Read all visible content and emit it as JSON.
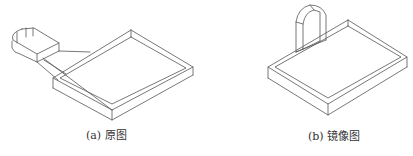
{
  "figures": [
    {
      "id": "a",
      "caption": "(a) 原图",
      "description": "Isometric wireframe of a rectangular tray with a stadium-shaped boss connected by lofted lines"
    },
    {
      "id": "b",
      "caption": "(b) 镜像图",
      "description": "Isometric wireframe of a rectangular tray with an upright arch-shaped feature (mirrored)"
    }
  ],
  "colors": {
    "line": "#555555",
    "text": "#333333",
    "background": "#ffffff"
  }
}
